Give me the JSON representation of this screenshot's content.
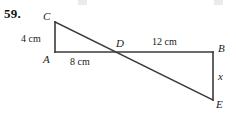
{
  "problem": {
    "number": "59."
  },
  "figure": {
    "vertices": [
      {
        "id": "C",
        "label": "C",
        "x": 55,
        "y": 22
      },
      {
        "id": "A",
        "label": "A",
        "x": 55,
        "y": 52
      },
      {
        "id": "D",
        "label": "D",
        "x": 120,
        "y": 52
      },
      {
        "id": "B",
        "label": "B",
        "x": 213,
        "y": 52
      },
      {
        "id": "E",
        "label": "E",
        "x": 213,
        "y": 100
      }
    ],
    "vertex_label_positions": {
      "C": {
        "left": 43,
        "top": 10
      },
      "A": {
        "left": 43,
        "top": 53
      },
      "D": {
        "left": 116,
        "top": 37
      },
      "B": {
        "left": 218,
        "top": 42
      },
      "E": {
        "left": 216,
        "top": 98
      }
    },
    "segments": [
      {
        "name": "CA",
        "from": "C",
        "to": "A"
      },
      {
        "name": "AB",
        "from": "A",
        "to": "B"
      },
      {
        "name": "BE",
        "from": "B",
        "to": "E"
      },
      {
        "name": "CE",
        "from": "C",
        "to": "E"
      }
    ],
    "measurements": [
      {
        "name": "CA",
        "text": "4 cm",
        "left": 21,
        "top": 33
      },
      {
        "name": "AD",
        "text": "8 cm",
        "left": 70,
        "top": 56
      },
      {
        "name": "DB",
        "text": "12 cm",
        "left": 152,
        "top": 36
      },
      {
        "name": "BE",
        "text": "x",
        "left": 218,
        "top": 70
      }
    ]
  },
  "colors": {
    "line": "#3a3a3a",
    "text": "#1a1a1a",
    "background": "#ffffff"
  }
}
